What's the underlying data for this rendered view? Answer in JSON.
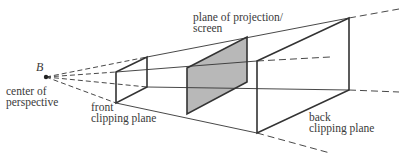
{
  "diagram": {
    "colors": {
      "line": "#333333",
      "shaded_plane": "#b8b8b8",
      "text": "#3a3a3a",
      "background": "#ffffff"
    },
    "point": {
      "label": "B",
      "name": "center of perspective"
    },
    "labels": {
      "point_label": "B",
      "center_line1": "center of",
      "center_line2": "perspective",
      "front_line1": "front",
      "front_line2": "clipping plane",
      "projection_line1": "plane of projection/",
      "projection_line2": "screen",
      "back_line1": "back",
      "back_line2": "clipping plane"
    },
    "planes": [
      {
        "name": "front clipping plane",
        "shaded": false
      },
      {
        "name": "plane of projection/screen",
        "shaded": true
      },
      {
        "name": "back clipping plane",
        "shaded": false
      }
    ]
  }
}
